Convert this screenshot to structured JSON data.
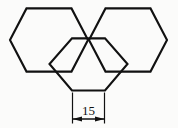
{
  "figure": {
    "background_color": "#fbfbfa",
    "line_color": "#111111",
    "shape_count": 3,
    "shape_kind": "regular hexagon"
  },
  "dimension": {
    "value": "15",
    "label": "15",
    "units": "",
    "applies_to": "bottom-edge-of-lower-hexagon",
    "arrow_style": "filled-inward-arrows",
    "text_color": "#111111"
  },
  "chart_data": {
    "type": "diagram",
    "hexagons": [
      {
        "name": "upper-left-hexagon",
        "center": [
          49,
          40
        ],
        "circumradius": 33,
        "orientation": "flat-top",
        "vertices": [
          [
            26.5,
            8.4
          ],
          [
            71.5,
            8.4
          ],
          [
            88.0,
            40.0
          ],
          [
            71.5,
            71.6
          ],
          [
            26.5,
            71.6
          ],
          [
            10.0,
            40.0
          ]
        ]
      },
      {
        "name": "upper-right-hexagon",
        "center": [
          128,
          40
        ],
        "circumradius": 33,
        "orientation": "flat-top",
        "vertices": [
          [
            105.5,
            8.4
          ],
          [
            150.5,
            8.4
          ],
          [
            167.0,
            40.0
          ],
          [
            150.5,
            71.6
          ],
          [
            105.5,
            71.6
          ],
          [
            89.0,
            40.0
          ]
        ]
      },
      {
        "name": "lower-middle-hexagon",
        "center": [
          88.5,
          64
        ],
        "circumradius": 33,
        "orientation": "flat-top",
        "vertices": [
          [
            72.0,
            38.4
          ],
          [
            105.0,
            38.4
          ],
          [
            127.5,
            64.0
          ],
          [
            105.0,
            90.5
          ],
          [
            72.0,
            90.5
          ],
          [
            49.5,
            64.0
          ]
        ]
      }
    ],
    "annotations": [
      {
        "kind": "linear-dimension",
        "text": "15",
        "from": [
          72,
          119
        ],
        "to": [
          105,
          119
        ],
        "extension_from_y": 92,
        "extension_to_y": 123,
        "text_position": [
          88.5,
          112
        ]
      }
    ]
  }
}
